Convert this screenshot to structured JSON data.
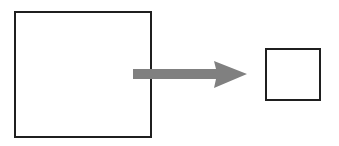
{
  "canvas": {
    "width": 339,
    "height": 146,
    "background_color": "#ffffff"
  },
  "diagram": {
    "type": "shape-transformation-diagram",
    "stroke_color": "#1f1f1f",
    "fill_color": "#ffffff",
    "arrow_color": "#808080"
  },
  "shapes": [
    {
      "name": "large-square",
      "role": "source",
      "x": 14,
      "y": 11,
      "width": 138,
      "height": 127,
      "border_width": 2,
      "border_color": "#1f1f1f",
      "fill": "#ffffff"
    },
    {
      "name": "small-square",
      "role": "target",
      "x": 265,
      "y": 48,
      "width": 56,
      "height": 53,
      "border_width": 2,
      "border_color": "#1f1f1f",
      "fill": "#ffffff"
    }
  ],
  "arrow": {
    "name": "transformation-arrow",
    "direction": "right",
    "color": "#808080",
    "tail_x": 133,
    "tip_x": 247,
    "center_y": 74,
    "shaft_thickness": 9,
    "head_length": 33,
    "head_half_height": 14,
    "head_notch_depth": 7,
    "points": "133,69 216,69 214,61 247,74 214,88 216,79 133,79"
  }
}
